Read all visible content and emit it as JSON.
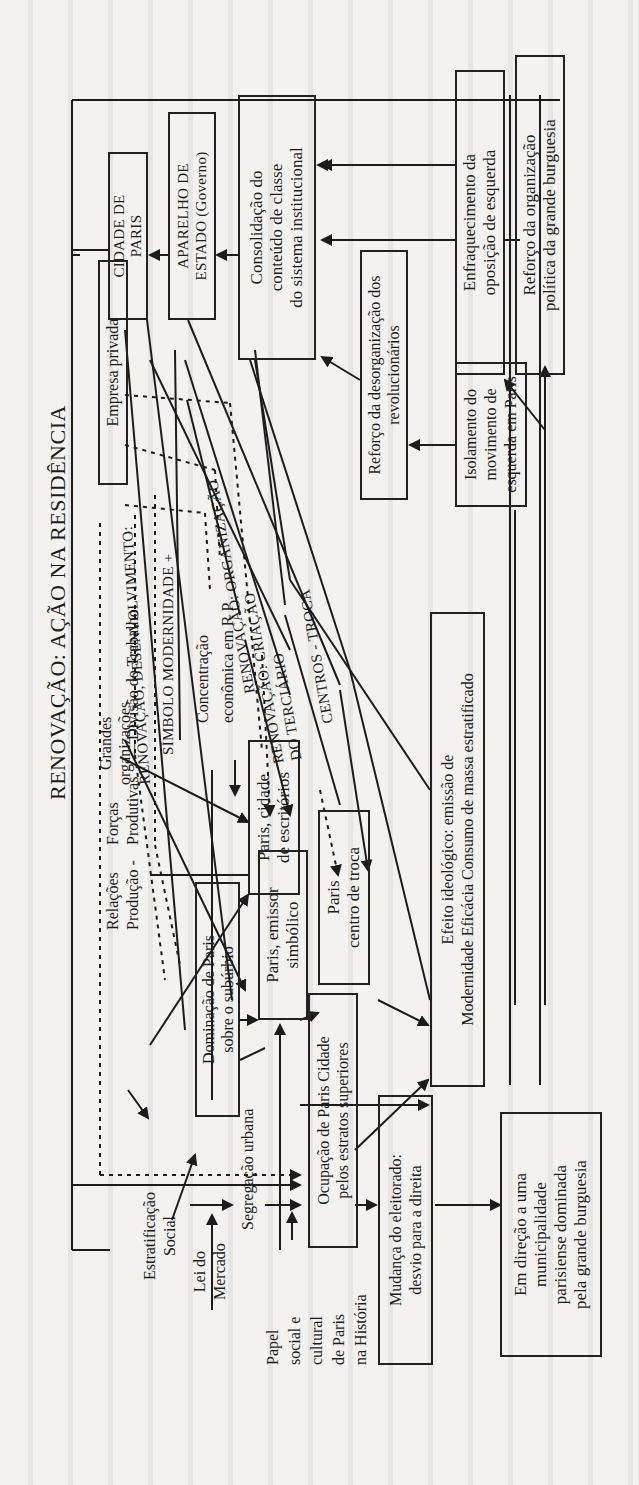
{
  "diagram": {
    "title": "RENOVAÇÃO: AÇÃO NA RESIDÊNCIA",
    "orientation": "rotated 90° counter-clockwise",
    "boxes": {
      "cidade_de_paris": "CIDADE DE\nPARIS",
      "aparelho_de_estado": "APARELHO DE\nESTADO (Governo)",
      "consolidacao": "Consolidação do\nconteúdo de classe\ndo sistema institucional",
      "enfraquecimento": "Enfraquecimento da\noposição de esquerda",
      "reforco_burguesia": "Reforço da organização\npolítica da grande burguesia",
      "empresa_privada": "Empresa privada",
      "reforco_desorganizacao": "Reforço da desorganização dos\nrevolucionários",
      "isolamento": "Isolamento do\nmovimento de\nesquerda em Paris",
      "efeito_ideologico": "Efeito ideológico: emissão de\nModernidade Eficácia Consumo de massa estratificado",
      "paris_escritorios": "Paris, cidade\nde escritórios",
      "paris_troca": "Paris\ncentro de troca",
      "dominacao": "Dominação de Paris\nsobre o subúrbio",
      "paris_emissor": "Paris, emissor\nsimbólico",
      "ocupacao": "Ocupação de Paris Cidade\npelos estratos superiores",
      "mudanca_eleitorado": "Mudança do eleitorado:\ndesvio para a direita",
      "em_direcao": "Em direção a uma\nmunicipalidade\nparisiense dominada\npela grande burguesia"
    },
    "labels": {
      "grandes_organizacoes": "Grandes\norganizações",
      "renovacao_desenvolvimento": "RENOVAÇÃO, DESENVOLVIMENTO:",
      "simbolo_modernidade": "SÍMBOLO MODERNIDADE +",
      "concentracao": "Concentração\neconômica em R P",
      "renovacao_organizacao": "RENOVAÇÃO: ORGANIZAÇÃO",
      "renovacao_terciario": "RENOVAÇÃO: CRIAÇÃO\nDO TERCIÁRIO",
      "renovacao_tenovacao": "DO TENOVAÇÃO: CRIAÇÃO",
      "renovacao_centros": "RENOVAÇÃO",
      "centros_troca": "CENTROS - TROCA",
      "relacoes_producao": "Relações\nProdução -",
      "forcas_produtivas": "Forças\nProdutivas",
      "divisao_trabalho": "— Divisão do Trabalho",
      "estratificacao_social": "Estratificação\nSocial",
      "lei_do_mercado": "Lei do\nMercado",
      "segregacao_urbana": "Segregação urbana",
      "papel_social": "Papel\nsocial e\ncultural\nde Paris\nna História"
    }
  }
}
